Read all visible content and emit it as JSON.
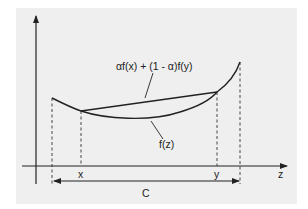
{
  "diagram": {
    "colors": {
      "background": "#efefef",
      "ink": "#222222",
      "page": "#ffffff"
    },
    "axes": {
      "horizontal_label": "z",
      "vertical_label": ""
    },
    "labels": {
      "chord": "αf(x) + (1 - α)f(y)",
      "curve": "f(z)",
      "point_x": "x",
      "point_y": "y",
      "set": "C"
    },
    "elements": [
      {
        "id": "curve",
        "type": "curve",
        "label_ref": "labels.curve"
      },
      {
        "id": "chord",
        "type": "line-segment",
        "label_ref": "labels.chord",
        "from": "x",
        "to": "y"
      },
      {
        "id": "set-arrow",
        "type": "double-arrow",
        "label_ref": "labels.set"
      }
    ]
  }
}
